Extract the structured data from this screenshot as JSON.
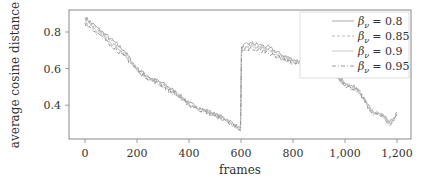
{
  "chart_data": {
    "type": "line",
    "title": "",
    "xlabel": "frames",
    "ylabel": "average cosine distance",
    "xlim": [
      -60,
      1240
    ],
    "ylim": [
      0.215,
      0.92
    ],
    "xticks": [
      0,
      200,
      400,
      600,
      800,
      1000,
      1200
    ],
    "xtick_labels": [
      "0",
      "200",
      "400",
      "600",
      "800",
      "1,000",
      "1,200"
    ],
    "yticks": [
      0.4,
      0.6,
      0.8
    ],
    "ytick_labels": [
      "0.4",
      "0.6",
      "0.8"
    ],
    "grid": false,
    "legend_position": "upper right",
    "series": [
      {
        "name": "β_ν = 0.8",
        "label_main": "β",
        "label_sub": "ν",
        "label_value": "= 0.8",
        "color": "#a0a0a0",
        "dash": "",
        "x": [
          0,
          50,
          100,
          150,
          200,
          250,
          300,
          350,
          400,
          450,
          500,
          550,
          598,
          602,
          640,
          700,
          750,
          800,
          850,
          900,
          950,
          1000,
          1050,
          1100,
          1150,
          1170,
          1190,
          1200
        ],
        "values": [
          0.88,
          0.82,
          0.76,
          0.7,
          0.6,
          0.55,
          0.52,
          0.47,
          0.41,
          0.38,
          0.35,
          0.32,
          0.27,
          0.72,
          0.74,
          0.72,
          0.68,
          0.65,
          0.63,
          0.63,
          0.6,
          0.52,
          0.49,
          0.37,
          0.34,
          0.3,
          0.33,
          0.36
        ]
      },
      {
        "name": "β_ν = 0.85",
        "label_main": "β",
        "label_sub": "ν",
        "label_value": "= 0.85",
        "color": "#b0b0b0",
        "dash": "3,2",
        "x": [
          0,
          50,
          100,
          150,
          200,
          250,
          300,
          350,
          400,
          450,
          500,
          550,
          598,
          602,
          640,
          700,
          750,
          800,
          850,
          900,
          950,
          1000,
          1050,
          1100,
          1150,
          1170,
          1190,
          1200
        ],
        "values": [
          0.87,
          0.81,
          0.75,
          0.69,
          0.6,
          0.55,
          0.51,
          0.47,
          0.41,
          0.38,
          0.35,
          0.32,
          0.27,
          0.71,
          0.73,
          0.71,
          0.67,
          0.64,
          0.63,
          0.62,
          0.6,
          0.52,
          0.49,
          0.37,
          0.34,
          0.3,
          0.33,
          0.36
        ]
      },
      {
        "name": "β_ν = 0.9",
        "label_main": "β",
        "label_sub": "ν",
        "label_value": "= 0.9",
        "color": "#c4c4c4",
        "dash": "",
        "x": [
          0,
          50,
          100,
          150,
          200,
          250,
          300,
          350,
          400,
          450,
          500,
          550,
          598,
          602,
          640,
          700,
          750,
          800,
          850,
          900,
          950,
          1000,
          1050,
          1100,
          1150,
          1170,
          1190,
          1200
        ],
        "values": [
          0.86,
          0.8,
          0.74,
          0.68,
          0.59,
          0.54,
          0.51,
          0.46,
          0.4,
          0.37,
          0.35,
          0.31,
          0.27,
          0.7,
          0.72,
          0.7,
          0.66,
          0.64,
          0.62,
          0.62,
          0.59,
          0.51,
          0.48,
          0.37,
          0.34,
          0.3,
          0.33,
          0.36
        ]
      },
      {
        "name": "β_ν = 0.95",
        "label_main": "β",
        "label_sub": "ν",
        "label_value": "= 0.95",
        "color": "#909090",
        "dash": "4,2,1,2",
        "x": [
          0,
          50,
          100,
          150,
          200,
          250,
          300,
          350,
          400,
          450,
          500,
          550,
          598,
          602,
          640,
          700,
          750,
          800,
          850,
          900,
          950,
          1000,
          1050,
          1100,
          1150,
          1170,
          1190,
          1200
        ],
        "values": [
          0.85,
          0.79,
          0.73,
          0.67,
          0.59,
          0.54,
          0.5,
          0.46,
          0.4,
          0.37,
          0.34,
          0.31,
          0.26,
          0.69,
          0.71,
          0.69,
          0.66,
          0.63,
          0.62,
          0.61,
          0.59,
          0.51,
          0.48,
          0.36,
          0.33,
          0.29,
          0.32,
          0.35
        ]
      }
    ]
  }
}
